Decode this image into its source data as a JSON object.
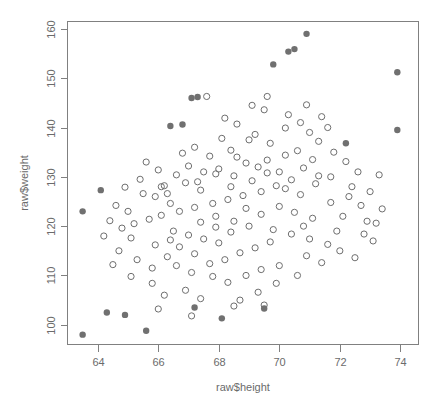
{
  "chart_data": {
    "type": "scatter",
    "title": "",
    "xlabel": "raw$height",
    "ylabel": "raw$weight",
    "xlim": [
      63.0,
      74.6
    ],
    "ylim": [
      96.0,
      161.5
    ],
    "xticks": [
      64,
      66,
      68,
      70,
      72,
      74
    ],
    "yticks": [
      100,
      110,
      120,
      130,
      140,
      150,
      160
    ],
    "grid": false,
    "legend": null,
    "series": [
      {
        "name": "open",
        "marker": "open-circle",
        "color": "#6e6e6e",
        "points": [
          [
            65.6,
            133.0
          ],
          [
            66.2,
            128.2
          ],
          [
            66.3,
            126.6
          ],
          [
            66.9,
            128.8
          ],
          [
            67.3,
            129.0
          ],
          [
            67.4,
            127.3
          ],
          [
            67.9,
            130.6
          ],
          [
            68.2,
            141.9
          ],
          [
            67.6,
            146.3
          ],
          [
            68.6,
            140.7
          ],
          [
            69.0,
            137.5
          ],
          [
            69.5,
            143.6
          ],
          [
            68.9,
            132.8
          ],
          [
            69.3,
            132.0
          ],
          [
            69.6,
            133.4
          ],
          [
            70.0,
            131.0
          ],
          [
            70.2,
            139.9
          ],
          [
            69.1,
            144.5
          ],
          [
            69.6,
            146.3
          ],
          [
            70.3,
            142.6
          ],
          [
            70.7,
            141.0
          ],
          [
            71.0,
            139.0
          ],
          [
            71.3,
            137.2
          ],
          [
            70.9,
            144.6
          ],
          [
            71.4,
            142.2
          ],
          [
            71.6,
            140.0
          ],
          [
            70.6,
            135.3
          ],
          [
            71.1,
            133.5
          ],
          [
            71.8,
            135.0
          ],
          [
            72.2,
            133.1
          ],
          [
            72.6,
            131.0
          ],
          [
            71.7,
            130.0
          ],
          [
            70.4,
            129.4
          ],
          [
            69.9,
            128.2
          ],
          [
            69.4,
            127.0
          ],
          [
            68.8,
            126.2
          ],
          [
            68.3,
            125.4
          ],
          [
            67.8,
            124.6
          ],
          [
            67.2,
            123.8
          ],
          [
            66.7,
            123.0
          ],
          [
            66.1,
            122.2
          ],
          [
            65.7,
            121.4
          ],
          [
            65.2,
            120.5
          ],
          [
            64.8,
            119.6
          ],
          [
            66.5,
            119.0
          ],
          [
            67.0,
            118.2
          ],
          [
            67.5,
            117.4
          ],
          [
            68.0,
            116.6
          ],
          [
            68.5,
            121.0
          ],
          [
            69.0,
            120.0
          ],
          [
            69.8,
            119.3
          ],
          [
            70.4,
            118.4
          ],
          [
            71.0,
            117.4
          ],
          [
            71.6,
            116.3
          ],
          [
            72.1,
            122.0
          ],
          [
            72.7,
            124.2
          ],
          [
            73.0,
            127.0
          ],
          [
            73.3,
            130.4
          ],
          [
            72.4,
            128.0
          ],
          [
            72.9,
            121.0
          ],
          [
            73.4,
            123.5
          ],
          [
            66.8,
            134.8
          ],
          [
            67.2,
            136.0
          ],
          [
            67.7,
            134.2
          ],
          [
            68.1,
            137.8
          ],
          [
            68.4,
            135.4
          ],
          [
            66.0,
            131.4
          ],
          [
            65.4,
            129.5
          ],
          [
            64.9,
            127.9
          ],
          [
            65.9,
            126.0
          ],
          [
            66.4,
            124.6
          ],
          [
            65.0,
            123.0
          ],
          [
            64.4,
            121.1
          ],
          [
            64.2,
            118.0
          ],
          [
            64.7,
            115.0
          ],
          [
            65.3,
            113.2
          ],
          [
            65.8,
            111.5
          ],
          [
            66.3,
            113.8
          ],
          [
            66.6,
            112.0
          ],
          [
            67.1,
            110.6
          ],
          [
            67.8,
            109.8
          ],
          [
            66.9,
            107.0
          ],
          [
            66.2,
            106.0
          ],
          [
            65.8,
            108.4
          ],
          [
            65.1,
            109.8
          ],
          [
            67.4,
            105.3
          ],
          [
            68.3,
            108.6
          ],
          [
            68.9,
            110.0
          ],
          [
            69.4,
            111.2
          ],
          [
            70.0,
            112.0
          ],
          [
            70.6,
            110.0
          ],
          [
            69.9,
            108.4
          ],
          [
            69.3,
            106.6
          ],
          [
            68.7,
            105.0
          ],
          [
            70.9,
            114.0
          ],
          [
            71.4,
            112.6
          ],
          [
            72.0,
            115.0
          ],
          [
            72.5,
            113.6
          ],
          [
            73.1,
            117.0
          ],
          [
            68.2,
            113.2
          ],
          [
            68.7,
            114.6
          ],
          [
            69.2,
            115.6
          ],
          [
            69.7,
            116.8
          ],
          [
            67.7,
            112.4
          ],
          [
            67.2,
            114.4
          ],
          [
            66.7,
            115.8
          ],
          [
            68.0,
            131.6
          ],
          [
            68.5,
            130.2
          ],
          [
            69.1,
            129.2
          ],
          [
            69.6,
            130.8
          ],
          [
            70.2,
            127.6
          ],
          [
            70.7,
            126.4
          ],
          [
            71.2,
            128.6
          ],
          [
            66.6,
            130.4
          ],
          [
            67.0,
            132.2
          ],
          [
            67.5,
            131.0
          ],
          [
            66.1,
            128.0
          ],
          [
            65.5,
            126.6
          ],
          [
            68.4,
            128.0
          ],
          [
            68.9,
            123.6
          ],
          [
            69.4,
            122.4
          ],
          [
            70.0,
            124.0
          ],
          [
            70.5,
            122.8
          ],
          [
            71.1,
            121.6
          ],
          [
            71.7,
            124.8
          ],
          [
            72.3,
            126.0
          ],
          [
            66.4,
            117.2
          ],
          [
            65.9,
            116.2
          ],
          [
            67.9,
            119.8
          ],
          [
            68.4,
            118.8
          ],
          [
            70.2,
            134.4
          ],
          [
            69.7,
            136.8
          ],
          [
            69.2,
            138.6
          ],
          [
            68.6,
            134.0
          ],
          [
            70.8,
            131.8
          ],
          [
            71.3,
            130.2
          ],
          [
            67.9,
            122.0
          ],
          [
            67.4,
            120.8
          ],
          [
            64.6,
            124.2
          ],
          [
            65.1,
            117.6
          ],
          [
            64.5,
            112.2
          ],
          [
            66.0,
            103.2
          ],
          [
            68.5,
            103.8
          ],
          [
            70.8,
            120.0
          ],
          [
            72.8,
            118.4
          ],
          [
            73.2,
            120.6
          ],
          [
            67.1,
            101.8
          ],
          [
            71.9,
            119.0
          ],
          [
            69.5,
            104.0
          ]
        ]
      },
      {
        "name": "filled",
        "marker": "filled-circle",
        "color": "#707070",
        "points": [
          [
            63.5,
            123.0
          ],
          [
            64.1,
            127.3
          ],
          [
            66.4,
            140.3
          ],
          [
            66.8,
            140.6
          ],
          [
            67.1,
            146.0
          ],
          [
            67.3,
            146.2
          ],
          [
            69.8,
            152.8
          ],
          [
            70.3,
            155.4
          ],
          [
            70.5,
            155.9
          ],
          [
            70.9,
            159.0
          ],
          [
            73.9,
            151.2
          ],
          [
            73.9,
            139.5
          ],
          [
            72.2,
            136.8
          ],
          [
            63.5,
            98.0
          ],
          [
            64.3,
            102.5
          ],
          [
            64.9,
            102.0
          ],
          [
            65.6,
            98.8
          ],
          [
            67.2,
            103.5
          ],
          [
            68.1,
            101.3
          ],
          [
            69.5,
            103.3
          ]
        ]
      }
    ]
  },
  "axes": {
    "x_title": "raw$height",
    "y_title": "raw$weight",
    "x_tick_labels": [
      "64",
      "66",
      "68",
      "70",
      "72",
      "74"
    ],
    "y_tick_labels": [
      "100",
      "110",
      "120",
      "130",
      "140",
      "150",
      "160"
    ]
  },
  "colors": {
    "frame": "#808080",
    "text": "#6b6b6b",
    "open_marker": "#6e6e6e",
    "filled_marker": "#707070",
    "background": "#ffffff"
  }
}
